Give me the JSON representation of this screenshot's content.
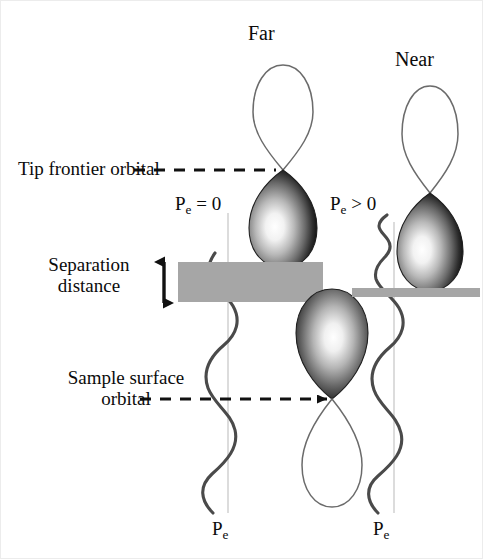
{
  "figure": {
    "width": 483,
    "height": 559,
    "background_color": "#ffffff",
    "border_color": "#e8e8e8"
  },
  "labels": {
    "far": "Far",
    "near": "Near",
    "tip_frontier_orbital": "Tip frontier orbital",
    "separation_distance_line1": "Separation",
    "separation_distance_line2": "distance",
    "sample_surface_orbital_line1": "Sample surface",
    "sample_surface_orbital_line2": "orbital",
    "pe_left": "P",
    "pe_left_sub": "e",
    "pe_left_rel": " = 0",
    "pe_right": "P",
    "pe_right_sub": "e",
    "pe_right_rel": " > 0",
    "pe_axis_left": "P",
    "pe_axis_left_sub": "e",
    "pe_axis_right": "P",
    "pe_axis_right_sub": "e"
  },
  "colors": {
    "ink": "#3a3a3a",
    "text": "#0b0b0b",
    "orbital_outline": "#5c5c5c",
    "orbital_dark": "#1a1a1a",
    "orbital_highlight": "#ffffff",
    "barrier_gray": "#a6a6a6",
    "axis_gray": "#d8d8d8",
    "wave_stroke": "#4a4a4a",
    "dashed_line": "#111111"
  },
  "geometry": {
    "far_column_x": 283,
    "near_column_x": 430,
    "sample_column_x": 332,
    "barrier_thick_left": 178,
    "barrier_thick_right": 323,
    "barrier_thick_top": 262,
    "barrier_thick_height": 40,
    "barrier_thin_left": 352,
    "barrier_thin_right": 480,
    "barrier_thin_top": 288,
    "barrier_thin_height": 9,
    "tip_node_y_far": 170,
    "tip_node_y_near": 193,
    "sample_node_y": 399,
    "separation_arrow_x": 164,
    "separation_arrow_top": 256,
    "separation_arrow_bottom": 308
  },
  "elements": {
    "tip_orbital_far": "two-lobe p-orbital, open outline lobe above node, dark shaded lobe below",
    "tip_orbital_near": "two-lobe p-orbital, open outline lobe above node, dark shaded lobe below",
    "sample_orbital": "two-lobe p-orbital, dark shaded lobe above node, open outline lobe below",
    "wave_far": "vertical sinusoidal electron probability wave, constant amplitude",
    "wave_near": "vertical sinusoidal electron probability wave, small amplitude above barrier growing below",
    "barrier_far": "thick gray separation block",
    "barrier_near": "thin gray surface bar",
    "leader_tip": "dashed horizontal leader line to tip orbital node",
    "leader_sample": "dashed horizontal leader line to sample orbital node",
    "separation_arrow": "vertical double-headed arrow"
  }
}
